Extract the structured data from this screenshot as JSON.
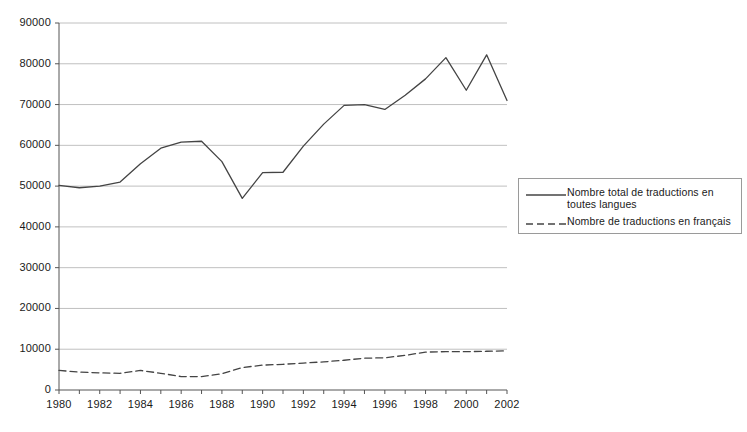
{
  "chart_data": {
    "type": "line",
    "title": "",
    "subtitle": "",
    "xlabel": "",
    "ylabel": "",
    "xlim": [
      1980,
      2002
    ],
    "ylim": [
      0,
      90000
    ],
    "grid": true,
    "grid_axis": "y",
    "legend_position": "right",
    "x": [
      1980,
      1981,
      1982,
      1983,
      1984,
      1985,
      1986,
      1987,
      1988,
      1989,
      1990,
      1991,
      1992,
      1993,
      1994,
      1995,
      1996,
      1997,
      1998,
      1999,
      2000,
      2001,
      2002
    ],
    "categories": [
      "1980",
      "1981",
      "1982",
      "1983",
      "1984",
      "1985",
      "1986",
      "1987",
      "1988",
      "1989",
      "1990",
      "1991",
      "1992",
      "1993",
      "1994",
      "1995",
      "1996",
      "1997",
      "1998",
      "1999",
      "2000",
      "2001",
      "2002"
    ],
    "xtick_labels": [
      "1980",
      "1982",
      "1984",
      "1986",
      "1988",
      "1990",
      "1992",
      "1994",
      "1996",
      "1998",
      "2000",
      "2002"
    ],
    "xtick_values": [
      1980,
      1982,
      1984,
      1986,
      1988,
      1990,
      1992,
      1994,
      1996,
      1998,
      2000,
      2002
    ],
    "ytick_labels": [
      "0",
      "10000",
      "20000",
      "30000",
      "40000",
      "50000",
      "60000",
      "70000",
      "80000",
      "90000"
    ],
    "ytick_values": [
      0,
      10000,
      20000,
      30000,
      40000,
      50000,
      60000,
      70000,
      80000,
      90000
    ],
    "series": [
      {
        "name": "Nombre total de traductions en toutes langues",
        "style": "solid",
        "color": "#444444",
        "values": [
          50200,
          49600,
          50000,
          51000,
          55500,
          59300,
          60800,
          61000,
          56000,
          47000,
          53300,
          53400,
          59800,
          65200,
          69800,
          70000,
          68800,
          72300,
          76300,
          81500,
          73500,
          82200,
          71000
        ]
      },
      {
        "name": "Nombre de traductions en français",
        "style": "dashed",
        "color": "#444444",
        "values": [
          4800,
          4400,
          4200,
          4100,
          4800,
          4100,
          3300,
          3300,
          4000,
          5500,
          6100,
          6300,
          6600,
          6900,
          7300,
          7800,
          7900,
          8500,
          9300,
          9400,
          9400,
          9500,
          9600
        ]
      }
    ]
  },
  "legend": {
    "entries": [
      {
        "label": "Nombre total de traductions en toutes langues",
        "style": "solid"
      },
      {
        "label": "Nombre de traductions en français",
        "style": "dashed"
      }
    ]
  },
  "colors": {
    "line": "#444444",
    "grid": "#b0b0b0",
    "axis": "#555555",
    "text": "#1a1a1a",
    "background": "#ffffff"
  }
}
